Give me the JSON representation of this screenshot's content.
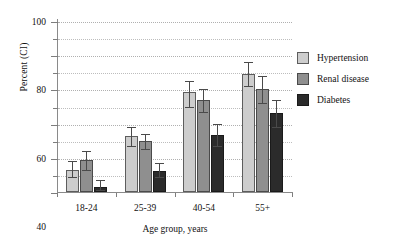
{
  "chart_data": {
    "type": "bar",
    "title": "",
    "xlabel": "Age group, years",
    "ylabel": "Percent (CI)",
    "categories": [
      "18-24",
      "25-39",
      "40-54",
      "55+"
    ],
    "ylim": [
      0,
      100
    ],
    "ytick_labels": [
      "0",
      "20",
      "40",
      "60",
      "80",
      "100"
    ],
    "ytick_values": [
      0,
      20,
      40,
      60,
      80,
      100
    ],
    "minor_tick_values": [
      10,
      30,
      50,
      70,
      90
    ],
    "gridlines": true,
    "grid_style": "dotted",
    "grid_values": [
      10,
      20,
      30,
      40,
      50,
      60,
      70,
      80,
      90,
      100
    ],
    "legend_position": "right",
    "series": [
      {
        "name": "Hypertension",
        "color": "#cdcdcd",
        "values": [
          13,
          33,
          58.5,
          69
        ],
        "ci_low": [
          9,
          27,
          50,
          62
        ],
        "ci_high": [
          18,
          38,
          65,
          76
        ]
      },
      {
        "name": "Renal disease",
        "color": "#8f8f8f",
        "values": [
          18.5,
          30,
          54,
          60.5
        ],
        "ci_low": [
          13,
          25,
          47,
          52
        ],
        "ci_high": [
          24,
          34,
          60,
          68
        ]
      },
      {
        "name": "Diabetes",
        "color": "#2b2b2b",
        "values": [
          3,
          12.5,
          33.5,
          46
        ],
        "ci_low": [
          1,
          9,
          27,
          38
        ],
        "ci_high": [
          7,
          17,
          40,
          54
        ]
      }
    ]
  },
  "axis": {
    "y_title": "Percent (CI)",
    "x_title": "Age group, years"
  }
}
